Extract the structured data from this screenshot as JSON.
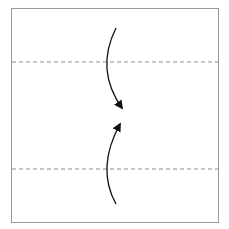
{
  "diagram": {
    "type": "origami-fold-step",
    "paper": {
      "x": 11.5,
      "y": 8.5,
      "width": 207,
      "height": 214,
      "stroke": "#9a9a9a"
    },
    "valley_folds": [
      {
        "name": "upper-valley-fold-line",
        "y": 62,
        "x1": 12,
        "x2": 218,
        "color": "#8c8c8c"
      },
      {
        "name": "lower-valley-fold-line",
        "y": 169,
        "x1": 12,
        "x2": 218,
        "color": "#8c8c8c"
      }
    ],
    "arrows": [
      {
        "name": "fold-top-edge-down-arrow",
        "path": "M116,28 Q95,70 122,108",
        "color": "#111111"
      },
      {
        "name": "fold-bottom-edge-up-arrow",
        "path": "M116,204 Q96,168 120,124",
        "color": "#111111"
      }
    ]
  }
}
